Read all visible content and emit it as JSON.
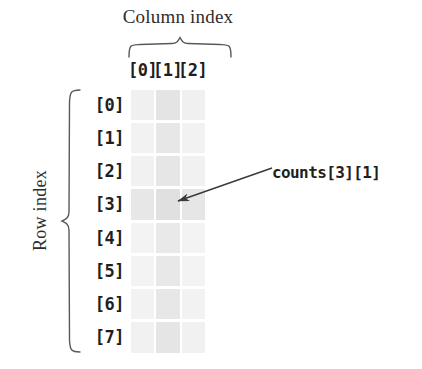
{
  "figure": {
    "column_index_title": "Column index",
    "row_index_title": "Row index",
    "column_labels": [
      "[0]",
      "[1]",
      "[2]"
    ],
    "row_labels": [
      "[0]",
      "[1]",
      "[2]",
      "[3]",
      "[4]",
      "[5]",
      "[6]",
      "[7]"
    ],
    "annotation": {
      "label": "counts[3][1]",
      "target_row": "[3]",
      "target_column": "[1]"
    },
    "colors": {
      "background": "#ffffff",
      "text": "#1f1f1f",
      "title_text": "#2e2e2e",
      "brace_stroke": "#5a5a5a",
      "arrow_stroke": "#3a3a3a",
      "cell_light": "#f1f1f1",
      "cell_medium": "#e6e6e6",
      "cell_highlight_row": "#e4e4e4",
      "cell_highlight_target": "#dcdcdc"
    },
    "grid": {
      "rows": 8,
      "columns": 3,
      "cell_shades": [
        [
          "#f0f0f0",
          "#e4e4e4",
          "#f0f0f0"
        ],
        [
          "#f2f2f2",
          "#e7e7e7",
          "#f2f2f2"
        ],
        [
          "#f1f1f1",
          "#e6e6e6",
          "#f1f1f1"
        ],
        [
          "#e7e7e7",
          "#e0e0e0",
          "#e6e6e6"
        ],
        [
          "#f3f3f3",
          "#e9e9e9",
          "#f3f3f3"
        ],
        [
          "#f3f3f3",
          "#e8e8e8",
          "#f3f3f3"
        ],
        [
          "#f2f2f2",
          "#e7e7e7",
          "#f2f2f2"
        ],
        [
          "#f1f1f1",
          "#e5e5e5",
          "#f1f1f1"
        ]
      ]
    }
  }
}
